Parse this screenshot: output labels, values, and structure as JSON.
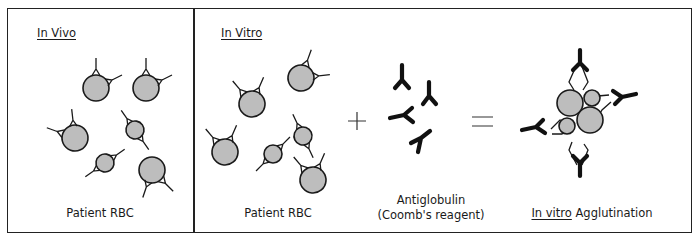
{
  "panels": {
    "in_vivo": {
      "heading": "In Vivo",
      "caption": "Patient RBC"
    },
    "in_vitro": {
      "heading": "In Vitro",
      "rbc_caption": "Patient RBC",
      "reagent_caption_line1": "Antiglobulin",
      "reagent_caption_line2": "(Coomb's reagent)",
      "result_caption_underlined": "In vitro",
      "result_caption_rest": " Agglutination"
    }
  },
  "operators": {
    "plus": "+",
    "equals": "="
  },
  "colors": {
    "cell_fill": "#bdbdbd",
    "outline": "#1a1a1a",
    "border": "#222222"
  }
}
